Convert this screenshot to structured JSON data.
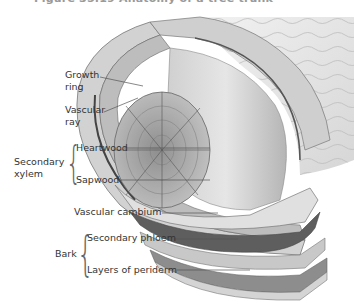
{
  "figure": {
    "title_partial": "Figure 35.19 Anatomy of a tree trunk",
    "labels": {
      "growth_ring": [
        "Growth",
        "ring"
      ],
      "vascular_ray": [
        "Vascular",
        "ray"
      ],
      "heartwood": "Heartwood",
      "sapwood": "Sapwood",
      "secondary_xylem": [
        "Secondary",
        "xylem"
      ],
      "vascular_cambium": "Vascular cambium",
      "secondary_phloem": "Secondary phloem",
      "bark": "Bark",
      "layers_of_periderm": "Layers of periderm"
    },
    "groups": [
      {
        "name": "Secondary xylem",
        "members": [
          "Heartwood",
          "Sapwood"
        ]
      },
      {
        "name": "Bark",
        "members": [
          "Secondary phloem",
          "Layers of periderm"
        ]
      }
    ],
    "colors": {
      "text": "#333333",
      "leader_line": "#555555",
      "bark_surface": "#e8e8e8",
      "wood_light": "#d9d9d9",
      "wood_mid": "#a8a8a8",
      "cambium_dark": "#5a5a5a"
    }
  }
}
